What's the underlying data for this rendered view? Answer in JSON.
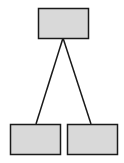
{
  "diagram": {
    "type": "tree",
    "colors": {
      "node_fill": "#d9d9d9",
      "stroke": "#1a1a1a",
      "background": "#ffffff"
    },
    "nodes": [
      {
        "id": "root",
        "x": 38,
        "y": 8,
        "w": 51,
        "h": 30,
        "label": ""
      },
      {
        "id": "left-child",
        "x": 10,
        "y": 124,
        "w": 51,
        "h": 30,
        "label": ""
      },
      {
        "id": "right-child",
        "x": 67,
        "y": 124,
        "w": 51,
        "h": 30,
        "label": ""
      }
    ],
    "edges": [
      {
        "from": "root",
        "to": "left-child",
        "x1": 63,
        "y1": 38,
        "x2": 36,
        "y2": 124
      },
      {
        "from": "root",
        "to": "right-child",
        "x1": 63,
        "y1": 38,
        "x2": 91,
        "y2": 124
      }
    ]
  }
}
